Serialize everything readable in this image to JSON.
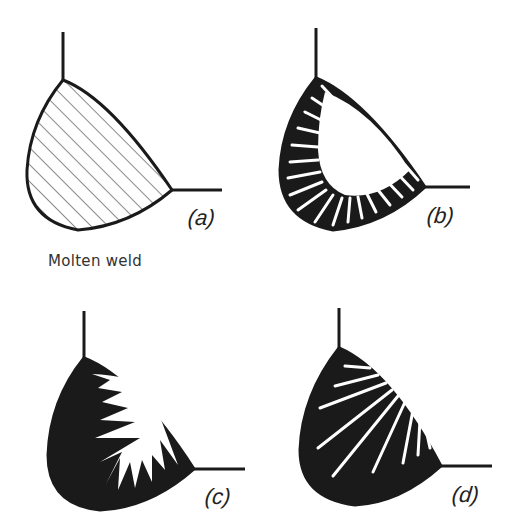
{
  "figure": {
    "caption": "Molten weld",
    "panels": [
      {
        "id": "a",
        "label": "(a)",
        "fill": "hatched",
        "description": "molten weld pool, hatched"
      },
      {
        "id": "b",
        "label": "(b)",
        "fill": "black-with-fine-spikes",
        "description": "solidification begins from fusion boundary with fine columnar spikes"
      },
      {
        "id": "c",
        "label": "(c)",
        "fill": "black-with-coarse-spikes",
        "description": "further solidification, shorter coarse spikes"
      },
      {
        "id": "d",
        "label": "(d)",
        "fill": "black-with-streaks",
        "description": "nearly solid with long narrow streaks"
      }
    ],
    "colors": {
      "ink": "#1a1a1a",
      "paper": "#ffffff"
    }
  }
}
